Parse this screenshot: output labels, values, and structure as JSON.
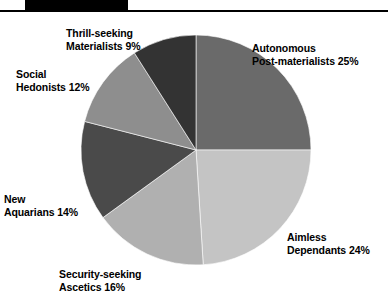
{
  "header": {
    "rule_color": "#000000",
    "block_color": "#000000"
  },
  "chart_data": {
    "type": "pie",
    "title": "",
    "subtitle": "",
    "xlabel": "",
    "ylabel": "",
    "legend_position": "outside-labels",
    "grid": false,
    "start_angle_deg": 0,
    "direction": "clockwise",
    "units": "percent",
    "total": 100,
    "categories": [
      "Autonomous Post-materialists",
      "Aimless Dependants",
      "Security-seeking Ascetics",
      "New Aquarians",
      "Social Hedonists",
      "Thrill-seeking Materialists"
    ],
    "values": [
      25,
      24,
      16,
      14,
      12,
      9
    ],
    "colors": [
      "#6a6a6a",
      "#c4c4c4",
      "#b0b0b0",
      "#4a4a4a",
      "#8e8e8e",
      "#333333"
    ],
    "slices": [
      {
        "name": "Autonomous Post-materialists",
        "value": 25,
        "color": "#6a6a6a"
      },
      {
        "name": "Aimless Dependants",
        "value": 24,
        "color": "#c4c4c4"
      },
      {
        "name": "Security-seeking Ascetics",
        "value": 16,
        "color": "#b0b0b0"
      },
      {
        "name": "New Aquarians",
        "value": 14,
        "color": "#4a4a4a"
      },
      {
        "name": "Social Hedonists",
        "value": 12,
        "color": "#8e8e8e"
      },
      {
        "name": "Thrill-seeking Materialists",
        "value": 9,
        "color": "#333333"
      }
    ]
  },
  "labels": {
    "thrill": {
      "line1": "Thrill-seeking",
      "line2": "Materialists 9%"
    },
    "autonomous": {
      "line1": "Autonomous",
      "line2": "Post-materialists 25%"
    },
    "social": {
      "line1": "Social",
      "line2": "Hedonists 12%"
    },
    "aquarians": {
      "line1": "New",
      "line2": "Aquarians 14%"
    },
    "ascetics": {
      "line1": "Security-seeking",
      "line2": "Ascetics 16%"
    },
    "aimless": {
      "line1": "Aimless",
      "line2": "Dependants 24%"
    }
  }
}
